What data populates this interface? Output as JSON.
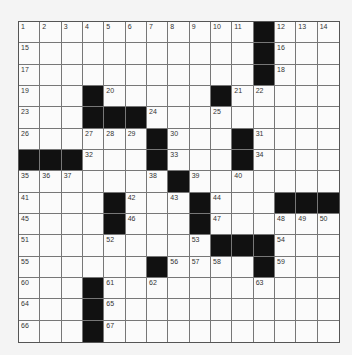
{
  "puzzle": {
    "rows": 15,
    "cols": 15,
    "colors": {
      "black": "#111111",
      "white": "#fbfbfb",
      "line": "#777777"
    },
    "black_cells": [
      [
        0,
        11
      ],
      [
        1,
        11
      ],
      [
        2,
        11
      ],
      [
        3,
        3
      ],
      [
        3,
        9
      ],
      [
        4,
        3
      ],
      [
        4,
        4
      ],
      [
        4,
        5
      ],
      [
        5,
        6
      ],
      [
        5,
        10
      ],
      [
        6,
        0
      ],
      [
        6,
        1
      ],
      [
        6,
        2
      ],
      [
        6,
        6
      ],
      [
        6,
        10
      ],
      [
        7,
        7
      ],
      [
        8,
        4
      ],
      [
        8,
        8
      ],
      [
        8,
        12
      ],
      [
        8,
        13
      ],
      [
        8,
        14
      ],
      [
        9,
        4
      ],
      [
        9,
        8
      ],
      [
        10,
        9
      ],
      [
        10,
        10
      ],
      [
        10,
        11
      ],
      [
        11,
        6
      ],
      [
        11,
        11
      ],
      [
        12,
        3
      ],
      [
        13,
        3
      ],
      [
        14,
        3
      ]
    ],
    "numbers": [
      [
        0,
        0,
        "1"
      ],
      [
        0,
        1,
        "2"
      ],
      [
        0,
        2,
        "3"
      ],
      [
        0,
        3,
        "4"
      ],
      [
        0,
        4,
        "5"
      ],
      [
        0,
        5,
        "6"
      ],
      [
        0,
        6,
        "7"
      ],
      [
        0,
        7,
        "8"
      ],
      [
        0,
        8,
        "9"
      ],
      [
        0,
        9,
        "10"
      ],
      [
        0,
        10,
        "11"
      ],
      [
        0,
        12,
        "12"
      ],
      [
        0,
        13,
        "13"
      ],
      [
        0,
        14,
        "14"
      ],
      [
        1,
        0,
        "15"
      ],
      [
        1,
        12,
        "16"
      ],
      [
        2,
        0,
        "17"
      ],
      [
        2,
        12,
        "18"
      ],
      [
        3,
        0,
        "19"
      ],
      [
        3,
        4,
        "20"
      ],
      [
        3,
        10,
        "21"
      ],
      [
        3,
        11,
        "22"
      ],
      [
        4,
        0,
        "23"
      ],
      [
        4,
        6,
        "24"
      ],
      [
        4,
        9,
        "25"
      ],
      [
        5,
        0,
        "26"
      ],
      [
        5,
        3,
        "27"
      ],
      [
        5,
        4,
        "28"
      ],
      [
        5,
        5,
        "29"
      ],
      [
        5,
        7,
        "30"
      ],
      [
        5,
        11,
        "31"
      ],
      [
        6,
        3,
        "32"
      ],
      [
        6,
        7,
        "33"
      ],
      [
        6,
        11,
        "34"
      ],
      [
        7,
        0,
        "35"
      ],
      [
        7,
        1,
        "36"
      ],
      [
        7,
        2,
        "37"
      ],
      [
        7,
        6,
        "38"
      ],
      [
        7,
        8,
        "39"
      ],
      [
        7,
        10,
        "40"
      ],
      [
        8,
        0,
        "41"
      ],
      [
        8,
        5,
        "42"
      ],
      [
        8,
        7,
        "43"
      ],
      [
        8,
        9,
        "44"
      ],
      [
        9,
        0,
        "45"
      ],
      [
        9,
        5,
        "46"
      ],
      [
        9,
        9,
        "47"
      ],
      [
        9,
        12,
        "48"
      ],
      [
        9,
        13,
        "49"
      ],
      [
        9,
        14,
        "50"
      ],
      [
        10,
        0,
        "51"
      ],
      [
        10,
        4,
        "52"
      ],
      [
        10,
        8,
        "53"
      ],
      [
        10,
        12,
        "54"
      ],
      [
        11,
        0,
        "55"
      ],
      [
        11,
        7,
        "56"
      ],
      [
        11,
        8,
        "57"
      ],
      [
        11,
        9,
        "58"
      ],
      [
        11,
        12,
        "59"
      ],
      [
        12,
        0,
        "60"
      ],
      [
        12,
        4,
        "61"
      ],
      [
        12,
        6,
        "62"
      ],
      [
        12,
        11,
        "63"
      ],
      [
        13,
        0,
        "64"
      ],
      [
        13,
        4,
        "65"
      ],
      [
        14,
        0,
        "66"
      ],
      [
        14,
        4,
        "67"
      ]
    ]
  }
}
